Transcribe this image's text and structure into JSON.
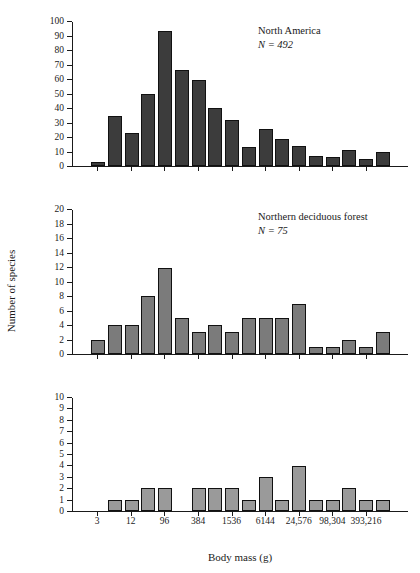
{
  "figure": {
    "axis_titles": {
      "y": "Number of species",
      "x": "Body mass (g)"
    }
  },
  "chart_data": [
    {
      "type": "bar",
      "title": "North America",
      "annotation": "N = 492",
      "sample_size": 492,
      "xlabel": "Body mass (g)",
      "ylabel": "Number of species",
      "ylim": [
        0,
        100
      ],
      "yticks": [
        0,
        10,
        20,
        30,
        40,
        50,
        60,
        70,
        80,
        90,
        100
      ],
      "grid": false,
      "bar_color": "#3c3c3c",
      "x_tick_labels": [
        "3",
        "12",
        "96",
        "384",
        "1536",
        "6144",
        "24,576",
        "98,304",
        "393,216"
      ],
      "x_tick_slots": [
        1,
        3,
        5,
        7,
        9,
        11,
        13,
        15,
        17
      ],
      "n_slots": 20,
      "values": [
        0,
        3,
        35,
        23,
        50,
        94,
        67,
        60,
        40,
        32,
        13,
        26,
        19,
        14,
        7,
        6,
        11,
        5,
        10,
        0
      ]
    },
    {
      "type": "bar",
      "title": "Northern deciduous forest",
      "annotation": "N = 75",
      "sample_size": 75,
      "xlabel": "Body mass (g)",
      "ylabel": "Number of species",
      "ylim": [
        0,
        20
      ],
      "yticks": [
        0,
        2,
        4,
        6,
        8,
        10,
        12,
        14,
        16,
        18,
        20
      ],
      "grid": false,
      "bar_color": "#7b7b7b",
      "x_tick_labels": [
        "3",
        "12",
        "96",
        "384",
        "1536",
        "6144",
        "24,576",
        "98,304",
        "393,216"
      ],
      "x_tick_slots": [
        1,
        3,
        5,
        7,
        9,
        11,
        13,
        15,
        17
      ],
      "n_slots": 20,
      "values": [
        0,
        2,
        4,
        4,
        8,
        12,
        5,
        3,
        4,
        3,
        5,
        5,
        5,
        7,
        1,
        1,
        2,
        1,
        3,
        0
      ]
    },
    {
      "type": "bar",
      "title": "Rio Grande Bosque",
      "annotation": "N = 27",
      "sample_size": 27,
      "xlabel": "Body mass (g)",
      "ylabel": "Number of species",
      "ylim": [
        0,
        10
      ],
      "yticks": [
        0,
        1,
        2,
        3,
        4,
        5,
        6,
        7,
        8,
        9,
        10
      ],
      "grid": false,
      "bar_color": "#9a9a9a",
      "x_tick_labels": [
        "3",
        "12",
        "96",
        "384",
        "1536",
        "6144",
        "24,576",
        "98,304",
        "393,216"
      ],
      "x_tick_slots": [
        1,
        3,
        5,
        7,
        9,
        11,
        13,
        15,
        17
      ],
      "n_slots": 20,
      "values": [
        0,
        0,
        1,
        1,
        2,
        2,
        0,
        2,
        2,
        2,
        1,
        3,
        1,
        4,
        1,
        1,
        2,
        1,
        1,
        0
      ]
    }
  ]
}
